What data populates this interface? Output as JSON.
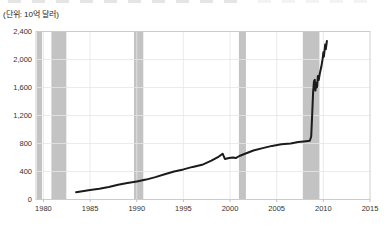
{
  "chart_data": {
    "type": "line",
    "title": "",
    "unit_label": "(단위: 10억 달러)",
    "xlabel": "",
    "ylabel": "",
    "grid": true,
    "legend": "none",
    "x_axis": {
      "range": [
        1979.2,
        2015
      ],
      "tick_values": [
        1980,
        1985,
        1990,
        1995,
        2000,
        2005,
        2010,
        2015
      ],
      "tick_labels": [
        "1980",
        "1985",
        "1990",
        "1995",
        "2000",
        "2005",
        "2010",
        "2015"
      ]
    },
    "y_axis": {
      "range": [
        0,
        2400
      ],
      "tick_values": [
        0,
        400,
        800,
        1200,
        1600,
        2000,
        2400
      ],
      "tick_labels": [
        "0",
        "400",
        "800",
        "1,200",
        "1,600",
        "2,000",
        "2,400"
      ]
    },
    "recession_bands": [
      {
        "from": 1979.3,
        "to": 1979.85
      },
      {
        "from": 1980.85,
        "to": 1982.45
      },
      {
        "from": 1989.7,
        "to": 1990.7
      },
      {
        "from": 2000.95,
        "to": 2001.7
      },
      {
        "from": 2007.8,
        "to": 2009.58
      }
    ],
    "series": [
      {
        "name": "monetary-base",
        "color": "#1b1b1b",
        "points": [
          [
            1983.5,
            105
          ],
          [
            1984,
            115
          ],
          [
            1985,
            135
          ],
          [
            1986,
            155
          ],
          [
            1987,
            180
          ],
          [
            1988,
            210
          ],
          [
            1989,
            235
          ],
          [
            1990,
            258
          ],
          [
            1991,
            285
          ],
          [
            1992,
            320
          ],
          [
            1993,
            360
          ],
          [
            1994,
            400
          ],
          [
            1995,
            430
          ],
          [
            1996,
            465
          ],
          [
            1997,
            495
          ],
          [
            1998,
            555
          ],
          [
            1998.7,
            605
          ],
          [
            1999.2,
            655
          ],
          [
            1999.45,
            580
          ],
          [
            1999.9,
            592
          ],
          [
            2000.3,
            600
          ],
          [
            2000.6,
            592
          ],
          [
            2001,
            622
          ],
          [
            2001.6,
            655
          ],
          [
            2002.5,
            700
          ],
          [
            2003.5,
            735
          ],
          [
            2004.5,
            765
          ],
          [
            2005.5,
            788
          ],
          [
            2006.5,
            800
          ],
          [
            2007.3,
            820
          ],
          [
            2007.9,
            830
          ],
          [
            2008.55,
            840
          ],
          [
            2008.7,
            900
          ],
          [
            2008.8,
            1220
          ],
          [
            2008.9,
            1530
          ],
          [
            2009.0,
            1690
          ],
          [
            2009.08,
            1710
          ],
          [
            2009.15,
            1555
          ],
          [
            2009.25,
            1665
          ],
          [
            2009.32,
            1605
          ],
          [
            2009.42,
            1765
          ],
          [
            2009.5,
            1705
          ],
          [
            2009.62,
            1800
          ],
          [
            2009.78,
            1895
          ],
          [
            2009.92,
            2005
          ],
          [
            2010.0,
            2105
          ],
          [
            2010.06,
            2040
          ],
          [
            2010.2,
            2215
          ],
          [
            2010.26,
            2145
          ],
          [
            2010.38,
            2265
          ]
        ]
      }
    ],
    "colors": {
      "band": "#c3c3c3",
      "grid": "#e6e6e6",
      "border": "#c9c9c9",
      "tick": "#b0b0b0",
      "line": "#1b1b1b",
      "label": "#333333",
      "background": "#ffffff"
    }
  }
}
